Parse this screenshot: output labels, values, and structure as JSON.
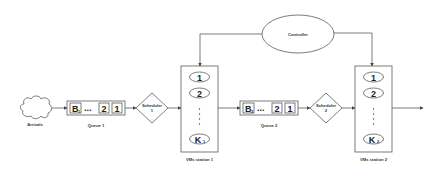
{
  "diagram": {
    "title": "",
    "colors": {
      "stroke": "#5a5a5a",
      "text": "#333333",
      "background": "#ffffff"
    },
    "arrivals": {
      "label": "Arrivals",
      "icon": "cloud-icon"
    },
    "queue1": {
      "label": "Queue 1",
      "cells": [
        "B",
        "2",
        "1"
      ],
      "first_sub": "1",
      "ellipsis": "..."
    },
    "scheduler1": {
      "label_line1": "Scheduler",
      "label_line2": "1"
    },
    "station1": {
      "label": "VMs station 1",
      "servers": [
        "1",
        "2"
      ],
      "last": "K",
      "last_sub": "1"
    },
    "controller": {
      "label": "Controller"
    },
    "queue2": {
      "label": "Queue 2",
      "cells": [
        "B",
        "2",
        "1"
      ],
      "first_sub": "2",
      "ellipsis": "..."
    },
    "scheduler2": {
      "label_line1": "Scheduler",
      "label_line2": "2"
    },
    "station2": {
      "label": "VMs station 2",
      "servers": [
        "1",
        "2"
      ],
      "last": "K",
      "last_sub": "2"
    }
  }
}
